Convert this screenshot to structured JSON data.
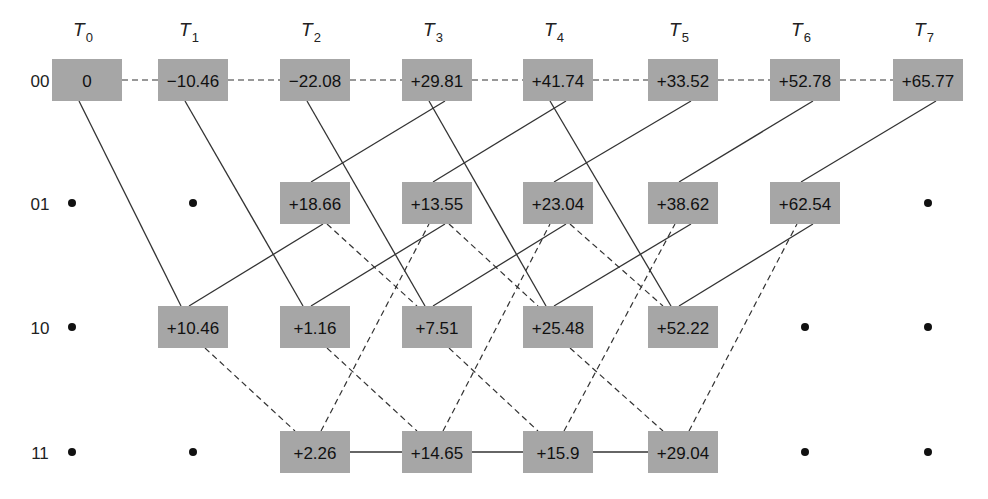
{
  "diagram": {
    "type": "trellis",
    "time_labels": [
      {
        "base": "T",
        "sub": "0"
      },
      {
        "base": "T",
        "sub": "1"
      },
      {
        "base": "T",
        "sub": "2"
      },
      {
        "base": "T",
        "sub": "3"
      },
      {
        "base": "T",
        "sub": "4"
      },
      {
        "base": "T",
        "sub": "5"
      },
      {
        "base": "T",
        "sub": "6"
      },
      {
        "base": "T",
        "sub": "7"
      }
    ],
    "states": [
      "00",
      "01",
      "10",
      "11"
    ],
    "nodes": {
      "00": [
        "0",
        "−10.46",
        "−22.08",
        "+29.81",
        "+41.74",
        "+33.52",
        "+52.78",
        "+65.77"
      ],
      "01": [
        null,
        null,
        "+18.66",
        "+13.55",
        "+23.04",
        "+38.62",
        "+62.54",
        null
      ],
      "10": [
        null,
        "+10.46",
        "+1.16",
        "+7.51",
        "+25.48",
        "+52.22",
        null,
        null
      ],
      "11": [
        null,
        null,
        "+2.26",
        "+14.65",
        "+15.9",
        "+29.04",
        null,
        null
      ]
    },
    "transitions": {
      "00->00": "dashed",
      "00->10": "solid",
      "01->00": "solid",
      "01->10": "dashed",
      "10->01": "solid",
      "10->11": "dashed",
      "11->01": "dashed",
      "11->11": "solid"
    },
    "legend_note": "solid and dashed lines denote the two branch types"
  },
  "colors": {
    "node_fill": "#a6a6a6",
    "line": "#333333",
    "text": "#111111",
    "background": "#ffffff"
  }
}
